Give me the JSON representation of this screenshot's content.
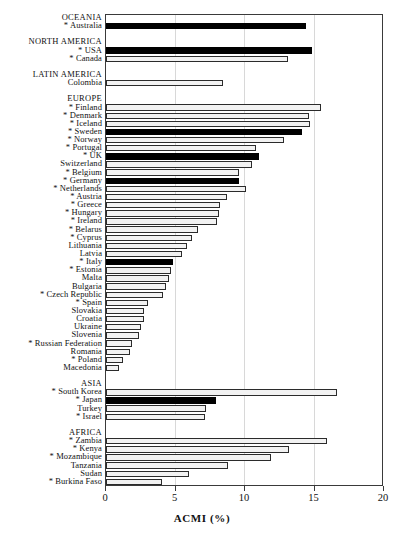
{
  "chart_data": {
    "type": "bar",
    "orientation": "horizontal",
    "title": "",
    "xlabel": "ACMI (%)",
    "ylabel": "",
    "xlim": [
      0,
      20
    ],
    "xticks": [
      0,
      5,
      10,
      15,
      20
    ],
    "xtick_labels": [
      "0",
      "5",
      "10",
      "15",
      "20"
    ],
    "grid": "vertical",
    "legend": "none",
    "note": "* marks countries flagged with an asterisk in the axis labels",
    "categories": [
      "OCEANIA",
      "* Australia",
      "",
      "NORTH AMERICA",
      "* USA",
      "* Canada",
      "",
      "LATIN AMERICA",
      "Colombia",
      "",
      "EUROPE",
      "* Finland",
      "* Denmark",
      "* Iceland",
      "* Sweden",
      "* Norway",
      "* Portugal",
      "* UK",
      "Switzerland",
      "* Belgium",
      "* Germany",
      "* Netherlands",
      "* Austria",
      "* Greece",
      "* Hungary",
      "* Ireland",
      "* Belarus",
      "* Cyprus",
      "Lithuania",
      "Latvia",
      "* Italy",
      "* Estonia",
      "Malta",
      "Bulgaria",
      "* Czech Republic",
      "* Spain",
      "Slovakia",
      "Croatia",
      "Ukraine",
      "Slovenia",
      "* Russian Federation",
      "Romania",
      "* Poland",
      "Macedonia",
      "",
      "ASIA",
      "* South Korea",
      "* Japan",
      "Turkey",
      "* Israel",
      "",
      "AFRICA",
      "* Zambia",
      "* Kenya",
      "* Mozambique",
      "Tanzania",
      "Sudan",
      "* Burkina Faso"
    ],
    "values": [
      null,
      14.4,
      null,
      null,
      14.8,
      13.1,
      null,
      null,
      8.4,
      null,
      null,
      15.5,
      14.6,
      14.7,
      14.1,
      12.8,
      10.8,
      11.0,
      10.5,
      9.6,
      9.6,
      10.1,
      8.7,
      8.2,
      8.1,
      8.0,
      6.6,
      6.2,
      5.8,
      5.5,
      4.8,
      4.7,
      4.5,
      4.3,
      4.1,
      3.0,
      2.7,
      2.7,
      2.5,
      2.4,
      1.9,
      1.7,
      1.2,
      0.9,
      null,
      null,
      16.6,
      7.9,
      7.2,
      7.1,
      null,
      null,
      15.9,
      13.2,
      11.9,
      8.8,
      6.0,
      4.0
    ],
    "fills": [
      null,
      "black",
      null,
      null,
      "black",
      "white",
      null,
      null,
      "white",
      null,
      null,
      "white",
      "white",
      "white",
      "black",
      "white",
      "white",
      "black",
      "white",
      "white",
      "black",
      "white",
      "white",
      "white",
      "white",
      "white",
      "white",
      "white",
      "white",
      "white",
      "black",
      "white",
      "white",
      "white",
      "white",
      "white",
      "white",
      "white",
      "white",
      "white",
      "white",
      "white",
      "white",
      "white",
      null,
      null,
      "white",
      "black",
      "white",
      "white",
      null,
      null,
      "white",
      "white",
      "white",
      "white",
      "white",
      "white"
    ],
    "group_rows": [
      "OCEANIA",
      "NORTH AMERICA",
      "LATIN AMERICA",
      "EUROPE",
      "ASIA",
      "AFRICA"
    ]
  },
  "colors": {
    "bar_dark": "#000000",
    "bar_light": "#f2f2f2",
    "bar_edge": "#2b2b2b",
    "grid": "#d8d8d8",
    "frame": "#3a3a3a",
    "text": "#111111",
    "background": "#ffffff"
  }
}
